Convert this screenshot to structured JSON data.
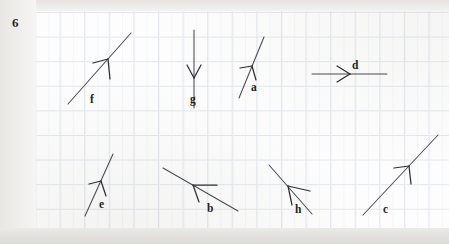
{
  "page": {
    "problem_number": "6",
    "sheet": {
      "background_color": "#fdfdfd",
      "grid_line_color": "#dfe4ea",
      "grid_spacing_px": 24.6
    },
    "scan_background_color": "#f4f3f1"
  },
  "vectors": [
    {
      "id": "f",
      "label": "f",
      "direction": "up-right",
      "label_x": 90,
      "label_y": 94,
      "tail_x": 68,
      "tail_y": 104,
      "tip_x": 131,
      "tip_y": 33,
      "head_x": 108,
      "head_y": 59,
      "head_left_x": 93,
      "head_left_y": 63,
      "head_down_x": 110,
      "head_down_y": 79
    },
    {
      "id": "g",
      "label": "g",
      "direction": "down",
      "label_x": 190,
      "label_y": 94,
      "tail_x": 194,
      "tail_y": 30,
      "tip_x": 194,
      "tip_y": 108,
      "head_x": 194,
      "head_y": 78,
      "head_left_x": 187,
      "head_left_y": 65,
      "head_right_x": 201,
      "head_right_y": 65
    },
    {
      "id": "a",
      "label": "a",
      "direction": "up-right",
      "label_x": 251,
      "label_y": 82,
      "tail_x": 239,
      "tail_y": 98,
      "tip_x": 264,
      "tip_y": 37,
      "head_x": 252,
      "head_y": 66,
      "head_left_x": 240,
      "head_left_y": 68,
      "head_down_x": 256,
      "head_down_y": 80
    },
    {
      "id": "d",
      "label": "d",
      "direction": "right",
      "label_x": 352,
      "label_y": 60,
      "tail_x": 312,
      "tail_y": 74,
      "tip_x": 387,
      "tip_y": 74,
      "head_x": 350,
      "head_y": 74,
      "head_up_x": 337,
      "head_up_y": 66,
      "head_down_x": 337,
      "head_down_y": 82
    },
    {
      "id": "e",
      "label": "e",
      "direction": "up-right",
      "label_x": 99,
      "label_y": 199,
      "tail_x": 85,
      "tail_y": 216,
      "tip_x": 113,
      "tip_y": 154,
      "head_x": 101,
      "head_y": 181,
      "head_left_x": 89,
      "head_left_y": 184,
      "head_down_x": 106,
      "head_down_y": 196
    },
    {
      "id": "b",
      "label": "b",
      "direction": "up-left",
      "label_x": 207,
      "label_y": 203,
      "tail_x": 238,
      "tail_y": 211,
      "tip_x": 163,
      "tip_y": 168,
      "head_x": 193,
      "head_y": 185,
      "head_right_x": 217,
      "head_right_y": 185,
      "head_down_x": 199,
      "head_down_y": 202
    },
    {
      "id": "h",
      "label": "h",
      "direction": "up-left",
      "label_x": 295,
      "label_y": 204,
      "tail_x": 312,
      "tail_y": 214,
      "tip_x": 269,
      "tip_y": 165,
      "head_x": 288,
      "head_y": 186,
      "head_right_x": 310,
      "head_right_y": 191,
      "head_down_x": 292,
      "head_down_y": 205
    },
    {
      "id": "c",
      "label": "c",
      "direction": "up-right",
      "label_x": 383,
      "label_y": 204,
      "tail_x": 363,
      "tail_y": 215,
      "tip_x": 438,
      "tip_y": 135,
      "head_x": 409,
      "head_y": 166,
      "head_left_x": 394,
      "head_left_y": 168,
      "head_down_x": 411,
      "head_down_y": 184
    }
  ]
}
